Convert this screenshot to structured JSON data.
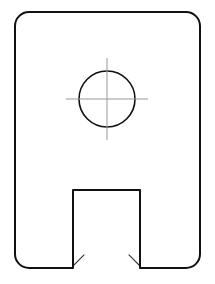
{
  "drawing": {
    "title": "Sectioned bracket plate with bore and bottom slot",
    "view_type": "section-view",
    "canvas": {
      "width": 215,
      "height": 284,
      "background": "#ffffff"
    },
    "colors": {
      "outline": "#111111",
      "hatch": "#333333",
      "centerline": "#999999",
      "fill": "#ffffff"
    },
    "stroke_widths": {
      "outline": 2.0,
      "hole": 1.6,
      "hatch": 1.1,
      "centerline": 1.0
    },
    "body": {
      "name": "plate-outline",
      "shape": "rounded-rectangle",
      "x": 15,
      "y": 12,
      "width": 185,
      "height": 256,
      "corner_radius": 14
    },
    "hole": {
      "name": "bore-circle",
      "shape": "circle",
      "cx": 107,
      "cy": 99,
      "r": 28
    },
    "centerlines": {
      "name": "hole-centerlines",
      "horizontal": {
        "x1": 66,
        "y1": 99,
        "x2": 148,
        "y2": 99
      },
      "vertical": {
        "x1": 107,
        "y1": 58,
        "x2": 107,
        "y2": 140
      }
    },
    "slot": {
      "name": "bottom-slot",
      "shape": "open-rectangle",
      "left": 73,
      "right": 140,
      "top": 190,
      "bottom": 268
    },
    "hatching": {
      "angle_deg": 45,
      "tick_length": 17,
      "spacing": 18,
      "edges": [
        {
          "name": "hatch-top-edge",
          "from": [
            30,
            13
          ],
          "to": [
            186,
            13
          ],
          "dir": [
            0.7071,
            0.7071
          ]
        },
        {
          "name": "hatch-left-edge",
          "from": [
            16,
            27
          ],
          "to": [
            16,
            254
          ],
          "dir": [
            0.7071,
            0.7071
          ]
        },
        {
          "name": "hatch-right-edge",
          "from": [
            199,
            27
          ],
          "to": [
            199,
            254
          ],
          "dir": [
            -0.7071,
            0.7071
          ]
        },
        {
          "name": "hatch-bottom-left-edge",
          "from": [
            30,
            267
          ],
          "to": [
            72,
            267
          ],
          "dir": [
            0.7071,
            -0.7071
          ]
        },
        {
          "name": "hatch-bottom-right-edge",
          "from": [
            141,
            267
          ],
          "to": [
            186,
            267
          ],
          "dir": [
            -0.7071,
            -0.7071
          ]
        },
        {
          "name": "hatch-slot-top-edge",
          "from": [
            74,
            189
          ],
          "to": [
            139,
            189
          ],
          "dir": [
            0.7071,
            -0.7071
          ]
        },
        {
          "name": "hatch-slot-left-edge",
          "from": [
            72,
            196
          ],
          "to": [
            72,
            262
          ],
          "dir": [
            -0.7071,
            -0.7071
          ]
        },
        {
          "name": "hatch-slot-right-edge",
          "from": [
            141,
            196
          ],
          "to": [
            141,
            262
          ],
          "dir": [
            0.7071,
            -0.7071
          ]
        },
        {
          "name": "hatch-bore-edge",
          "circle": true,
          "cx": 107,
          "cy": 99,
          "r": 28,
          "count": 12,
          "outward": true
        }
      ]
    }
  }
}
